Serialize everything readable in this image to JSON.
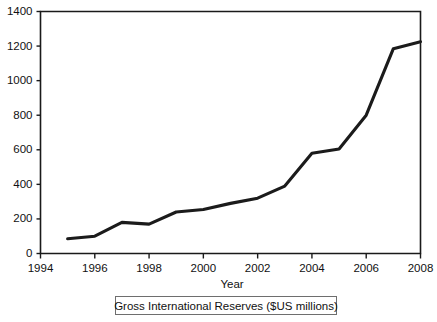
{
  "chart_data": {
    "type": "line",
    "title": "",
    "subtitle": "",
    "xlabel": "Year",
    "ylabel": "",
    "legend": [
      "Gross International Reserves ($US millions)"
    ],
    "legend_position": "bottom",
    "grid": false,
    "xlim": [
      1994,
      2008
    ],
    "ylim": [
      0,
      1400
    ],
    "xticks": [
      1994,
      1996,
      1998,
      2000,
      2002,
      2004,
      2006,
      2008
    ],
    "xtick_labels": [
      "1994",
      "1996",
      "1998",
      "2000",
      "2002",
      "2004",
      "2006",
      "2008"
    ],
    "yticks": [
      0,
      200,
      400,
      600,
      800,
      1000,
      1200,
      1400
    ],
    "ytick_labels": [
      "0",
      "200",
      "400",
      "600",
      "800",
      "1000",
      "1200",
      "1400"
    ],
    "x": [
      1995,
      1996,
      1997,
      1998,
      1999,
      2000,
      2001,
      2002,
      2003,
      2004,
      2005,
      2006,
      2007,
      2008
    ],
    "series": [
      {
        "name": "Gross International Reserves ($US millions)",
        "color": "#1b1b1b",
        "values": [
          85,
          100,
          180,
          170,
          240,
          255,
          290,
          320,
          390,
          580,
          605,
          800,
          1185,
          1225
        ]
      }
    ]
  },
  "axes": {
    "x_title": "Year",
    "y_title": ""
  },
  "legend": {
    "label": "Gross International Reserves ($US millions)"
  }
}
